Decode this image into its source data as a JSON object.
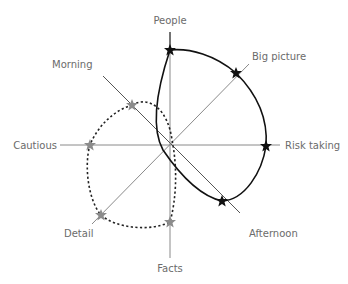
{
  "diagram": {
    "type": "radar-comparison",
    "center": [
      170,
      145
    ],
    "colors": {
      "axis": "#8a8a8a",
      "label": "#6b6b6b",
      "profile_a": "#111111",
      "profile_b": "#8c8c8c",
      "background": "#ffffff"
    },
    "axes": [
      {
        "id": "people",
        "label": "People"
      },
      {
        "id": "big_picture",
        "label": "Big picture"
      },
      {
        "id": "risk_taking",
        "label": "Risk taking"
      },
      {
        "id": "afternoon",
        "label": "Afternoon"
      },
      {
        "id": "facts",
        "label": "Facts"
      },
      {
        "id": "detail",
        "label": "Detail"
      },
      {
        "id": "cautious",
        "label": "Cautious"
      },
      {
        "id": "morning",
        "label": "Morning"
      }
    ],
    "profiles": [
      {
        "name": "solid-black-profile",
        "line_style": "solid",
        "marker": "black-star",
        "points": [
          "People",
          "Big picture",
          "Risk taking",
          "Afternoon"
        ]
      },
      {
        "name": "dashed-grey-profile",
        "line_style": "dotted",
        "marker": "grey-star",
        "points": [
          "Morning",
          "Cautious",
          "Detail",
          "Facts"
        ]
      }
    ]
  }
}
